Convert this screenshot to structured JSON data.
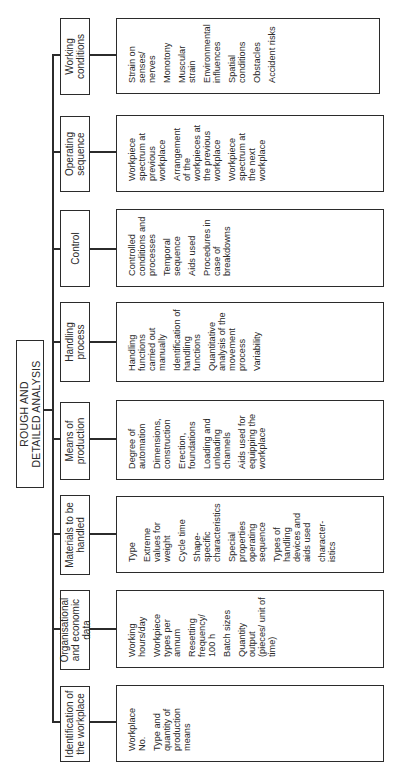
{
  "root": {
    "title": "ROUGH AND\nDETAILED ANALYSIS"
  },
  "categories": [
    {
      "label": "Identification of the workplace",
      "items": [
        "Workplace No.",
        "Type and quantity of production means"
      ]
    },
    {
      "label": "Organisational and economic data",
      "items": [
        "Working hours/day",
        "Workpiece types per annum",
        "Resetting frequency/ 100 h",
        "Batch sizes",
        "Quantity output (pieces/ unit of time)"
      ]
    },
    {
      "label": "Materials to be handled",
      "items": [
        "Type",
        "Extreme values for weight",
        "Cycle time",
        "Shape-specific characteristics",
        "Special properties operating sequence",
        "Types of handling devices and aids used",
        "character-istics"
      ]
    },
    {
      "label": "Means of production",
      "items": [
        "Degree of automation",
        "Dimensions, construction",
        "Erection, foundations",
        "Loading and unloading channels",
        "Aids used for equipping the workplace"
      ]
    },
    {
      "label": "Handling process",
      "items": [
        "Handling functions carried out manually",
        "Identification of handling functions",
        "Quantitative analysis of the movement process",
        "Variability"
      ]
    },
    {
      "label": "Control",
      "items": [
        "Controlled conditions and processes",
        "Temporal sequence",
        "Aids used",
        "Procedures in case of breakdowns"
      ]
    },
    {
      "label": "Operating sequence",
      "items": [
        "Workpiece spectrum at previous workplace",
        "Arrangement of the workpieces at the previous workplace",
        "Workpiece spectrum at the next workplace"
      ]
    },
    {
      "label": "Working conditions",
      "items": [
        "Strain on senses/ nerves",
        "Monotony",
        "Muscular strain",
        "Environmental influences",
        "Spatial conditions",
        "Obstacles",
        "Accident risks"
      ]
    }
  ]
}
